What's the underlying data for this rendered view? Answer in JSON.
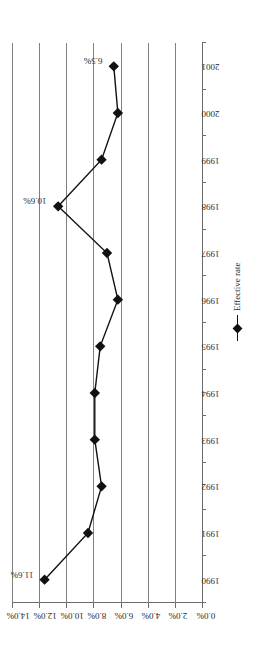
{
  "chart_data": {
    "type": "line",
    "title": "",
    "xlabel": "",
    "ylabel": "",
    "orientation": "rotated-90-ccw",
    "categories": [
      "1990",
      "1991",
      "1992",
      "1993",
      "1994",
      "1995",
      "1996",
      "1997",
      "1998",
      "1999",
      "2000",
      "2001"
    ],
    "series": [
      {
        "name": "Effective rate",
        "values": [
          11.6,
          8.4,
          7.4,
          7.9,
          7.9,
          7.5,
          6.2,
          7.0,
          10.6,
          7.4,
          6.2,
          6.5
        ],
        "marker": "diamond",
        "color": "#111111"
      }
    ],
    "ylim": [
      0,
      14
    ],
    "ytick_labels": [
      "14.0%",
      "12.0%",
      "10.0%",
      "8.0%",
      "6.0%",
      "4.0%",
      "2.0%",
      "0.0%"
    ],
    "ytick_values": [
      14,
      12,
      10,
      8,
      6,
      4,
      2,
      0
    ],
    "grid": true,
    "grid_axis": "value",
    "legend": {
      "position": "below-right",
      "entries": [
        "Effective rate"
      ]
    },
    "point_labels": [
      {
        "category": "1990",
        "value": 11.6,
        "text": "11.6%"
      },
      {
        "category": "1998",
        "value": 10.6,
        "text": "10.6%"
      },
      {
        "category": "2001",
        "value": 6.5,
        "text": "6.5%"
      }
    ]
  }
}
